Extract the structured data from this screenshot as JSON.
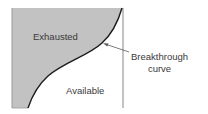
{
  "diagram": {
    "regions": {
      "exhausted": {
        "label": "Exhausted",
        "fill": "#c2c2c2"
      },
      "available": {
        "label": "Available",
        "fill": "#ffffff"
      }
    },
    "curve": {
      "label_line1": "Breakthrough",
      "label_line2": "curve",
      "stroke": "#1a1a1a"
    },
    "frame": {
      "stroke": "#9a9a9a"
    }
  }
}
